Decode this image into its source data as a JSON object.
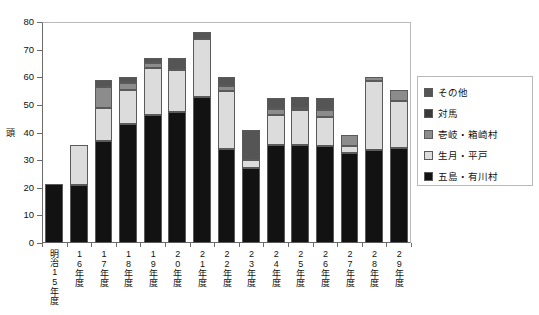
{
  "chart_data": {
    "type": "bar",
    "stacked": true,
    "title": "",
    "xlabel": "",
    "ylabel": "頭",
    "ylim": [
      0,
      80
    ],
    "yticks": [
      0,
      10,
      20,
      30,
      40,
      50,
      60,
      70,
      80
    ],
    "grid": false,
    "legend_position": "right",
    "categories": [
      "明治15年度",
      "16年度",
      "17年度",
      "18年度",
      "19年度",
      "20年度",
      "21年度",
      "22年度",
      "23年度",
      "24年度",
      "25年度",
      "26年度",
      "27年度",
      "28年度",
      "29年度"
    ],
    "series": [
      {
        "name": "五島・有川村",
        "color": "#121212",
        "values": [
          21.5,
          21.0,
          37.0,
          43.0,
          46.5,
          47.5,
          53.0,
          34.0,
          27.0,
          35.5,
          35.5,
          35.0,
          32.5,
          33.5,
          34.5
        ]
      },
      {
        "name": "生月・平戸",
        "color": "#dcdcdc",
        "values": [
          0,
          14.5,
          12.0,
          12.5,
          17.0,
          15.0,
          21.0,
          21.0,
          3.0,
          11.0,
          12.5,
          10.5,
          2.5,
          25.0,
          17.0
        ]
      },
      {
        "name": "壱岐・箱崎村",
        "color": "#8c8c8c",
        "values": [
          0,
          0,
          7.5,
          2.5,
          1.5,
          0,
          0,
          2.0,
          0,
          2.0,
          1.0,
          2.5,
          4.0,
          1.5,
          4.0
        ]
      },
      {
        "name": "対馬",
        "color": "#3a3a3a",
        "values": [
          0,
          0,
          0,
          0,
          0,
          0,
          0,
          0,
          0,
          0,
          0,
          0,
          0,
          0,
          0
        ]
      },
      {
        "name": "その他",
        "color": "#555555",
        "values": [
          0,
          0,
          2.5,
          2.0,
          2.0,
          4.5,
          2.5,
          3.0,
          11.0,
          4.0,
          4.0,
          4.5,
          0,
          0,
          0
        ]
      }
    ]
  },
  "legend": {
    "items": [
      {
        "label": "その他",
        "color": "#555555"
      },
      {
        "label": "対馬",
        "color": "#3a3a3a"
      },
      {
        "label": "壱岐・箱崎村",
        "color": "#8c8c8c"
      },
      {
        "label": "生月・平戸",
        "color": "#dcdcdc"
      },
      {
        "label": "五島・有川村",
        "color": "#121212"
      }
    ]
  },
  "axes": {
    "y_title": "頭",
    "y_tick_labels": [
      "80",
      "70",
      "60",
      "50",
      "40",
      "30",
      "20",
      "10",
      "0"
    ]
  }
}
